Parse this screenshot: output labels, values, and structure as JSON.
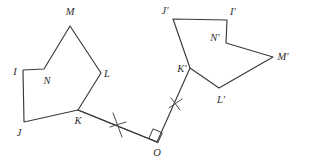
{
  "figure": {
    "background_color": "#ffffff",
    "stroke_color": "#3a3a3a",
    "label_color": "#2e2e2e",
    "preimage": {
      "name": "pentagon-IJKLMN",
      "vertices": [
        {
          "id": "I",
          "label": "I",
          "x": 23,
          "y": 70,
          "label_x": 15,
          "label_y": 73
        },
        {
          "id": "J",
          "label": "J",
          "x": 24,
          "y": 122,
          "label_x": 19,
          "label_y": 134
        },
        {
          "id": "K",
          "label": "K",
          "x": 78,
          "y": 110,
          "label_x": 78,
          "label_y": 122
        },
        {
          "id": "L",
          "label": "L",
          "x": 101,
          "y": 73,
          "label_x": 107,
          "label_y": 75
        },
        {
          "id": "M",
          "label": "M",
          "x": 70,
          "y": 26,
          "label_x": 70,
          "label_y": 13
        },
        {
          "id": "N",
          "label": "N",
          "x": 44,
          "y": 69,
          "label_x": 47,
          "label_y": 82
        }
      ],
      "path": "M 23 70 L 44 69 L 70 26 L 101 73 L 78 110 L 24 122 Z"
    },
    "image": {
      "name": "pentagon-IJKLMN-prime",
      "vertices": [
        {
          "id": "I_prime",
          "label": "I′",
          "x": 227,
          "y": 20,
          "label_x": 233,
          "label_y": 13
        },
        {
          "id": "J_prime",
          "label": "J′",
          "x": 173,
          "y": 19,
          "label_x": 165,
          "label_y": 12
        },
        {
          "id": "K_prime",
          "label": "K′",
          "x": 190,
          "y": 68,
          "label_x": 182,
          "label_y": 70
        },
        {
          "id": "L_prime",
          "label": "L′",
          "x": 219,
          "y": 88,
          "label_x": 221,
          "label_y": 101
        },
        {
          "id": "M_prime",
          "label": "M′",
          "x": 273,
          "y": 57,
          "label_x": 283,
          "label_y": 58
        },
        {
          "id": "N_prime",
          "label": "N′",
          "x": 226,
          "y": 43,
          "label_x": 215,
          "label_y": 39
        }
      ],
      "path": "M 173 19 L 227 20 L 226 43 L 273 57 L 219 88 L 190 68 Z"
    },
    "center_of_rotation": {
      "id": "O",
      "label": "O",
      "x": 157,
      "y": 142,
      "label_x": 157,
      "label_y": 153
    },
    "connectors": [
      {
        "name": "segment-K-O",
        "from": "K",
        "to": "O",
        "x1": 78,
        "y1": 110,
        "x2": 157,
        "y2": 142,
        "tick_marks": 1,
        "tick_label": "∗"
      },
      {
        "name": "segment-O-K-prime",
        "from": "O",
        "to": "K_prime",
        "x1": 157,
        "y1": 142,
        "x2": 190,
        "y2": 68,
        "tick_marks": 1,
        "tick_label": "∗"
      }
    ],
    "right_angle_marker": {
      "name": "right-angle-at-O",
      "present": true,
      "at_vertex": "O",
      "size": 9
    }
  }
}
